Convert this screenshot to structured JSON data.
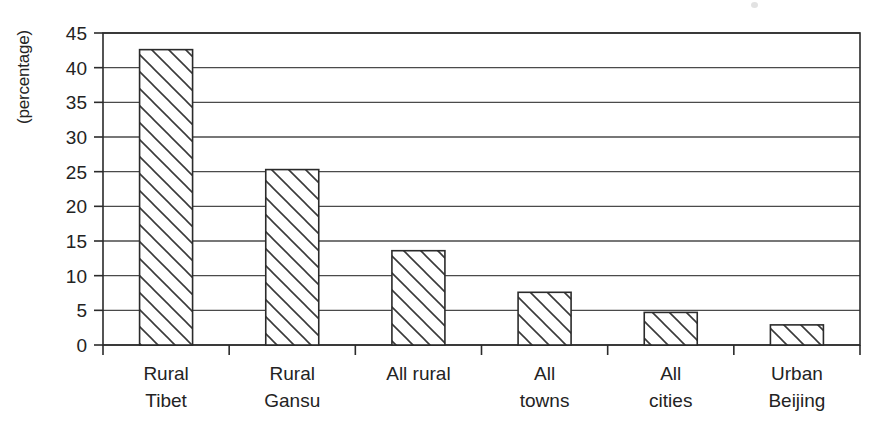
{
  "chart_data": {
    "type": "bar",
    "title": "",
    "xlabel": "",
    "ylabel": "(percentage)",
    "categories": [
      "Rural Tibet",
      "Rural Gansu",
      "All rural",
      "All towns",
      "All cities",
      "Urban Beijing"
    ],
    "category_lines": [
      [
        "Rural",
        "Tibet"
      ],
      [
        "Rural",
        "Gansu"
      ],
      [
        "All rural",
        ""
      ],
      [
        "All",
        "towns"
      ],
      [
        "All",
        "cities"
      ],
      [
        "Urban",
        "Beijing"
      ]
    ],
    "values": [
      42.6,
      25.3,
      13.6,
      7.6,
      4.7,
      2.9
    ],
    "ylim": [
      0,
      45
    ],
    "ytick_values": [
      0,
      5,
      10,
      15,
      20,
      25,
      30,
      35,
      40,
      45
    ],
    "ytick_labels": [
      "0",
      "5",
      "10",
      "15",
      "20",
      "25",
      "30",
      "35",
      "40",
      "45"
    ],
    "grid": true,
    "grid_axis": "y",
    "legend": "none",
    "bar_fill": "#ffffff",
    "bar_edge": "#2b2b2b",
    "bar_hatch": "diagonal-backslash",
    "axis_color": "#2b2b2b",
    "grid_color": "#4a4a4a",
    "background": "#ffffff"
  }
}
